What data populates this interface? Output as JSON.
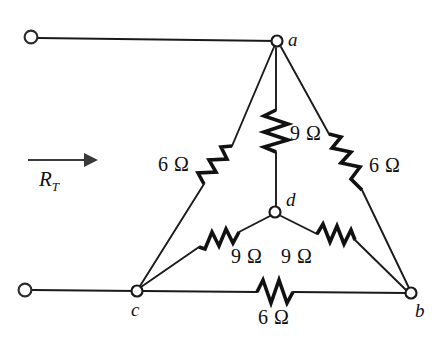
{
  "figure": {
    "background_color": "#ffffff",
    "line_color": "#1a1a1a"
  },
  "source_label": {
    "symbol": "R",
    "subscript": "T",
    "arrow_direction": "right"
  },
  "nodes": [
    {
      "id": "a",
      "label": "a",
      "x": 277,
      "y": 41
    },
    {
      "id": "b",
      "label": "b",
      "x": 411,
      "y": 293
    },
    {
      "id": "c",
      "label": "c",
      "x": 137,
      "y": 291
    },
    {
      "id": "d",
      "label": "d",
      "x": 275,
      "y": 212
    }
  ],
  "terminals": [
    {
      "id": "top-left",
      "x": 31,
      "y": 37
    },
    {
      "id": "bottom-left",
      "x": 25,
      "y": 290
    }
  ],
  "resistors": [
    {
      "id": "r-a-c",
      "label": "6 Ω",
      "value": 6,
      "unit": "Ω",
      "between": [
        "a",
        "c"
      ]
    },
    {
      "id": "r-a-b",
      "label": "6 Ω",
      "value": 6,
      "unit": "Ω",
      "between": [
        "a",
        "b"
      ]
    },
    {
      "id": "r-c-b",
      "label": "6 Ω",
      "value": 6,
      "unit": "Ω",
      "between": [
        "c",
        "b"
      ]
    },
    {
      "id": "r-a-d",
      "label": "9 Ω",
      "value": 9,
      "unit": "Ω",
      "between": [
        "a",
        "d"
      ]
    },
    {
      "id": "r-c-d",
      "label": "9 Ω",
      "value": 9,
      "unit": "Ω",
      "between": [
        "c",
        "d"
      ]
    },
    {
      "id": "r-d-b",
      "label": "9 Ω",
      "value": 9,
      "unit": "Ω",
      "between": [
        "d",
        "b"
      ]
    }
  ]
}
